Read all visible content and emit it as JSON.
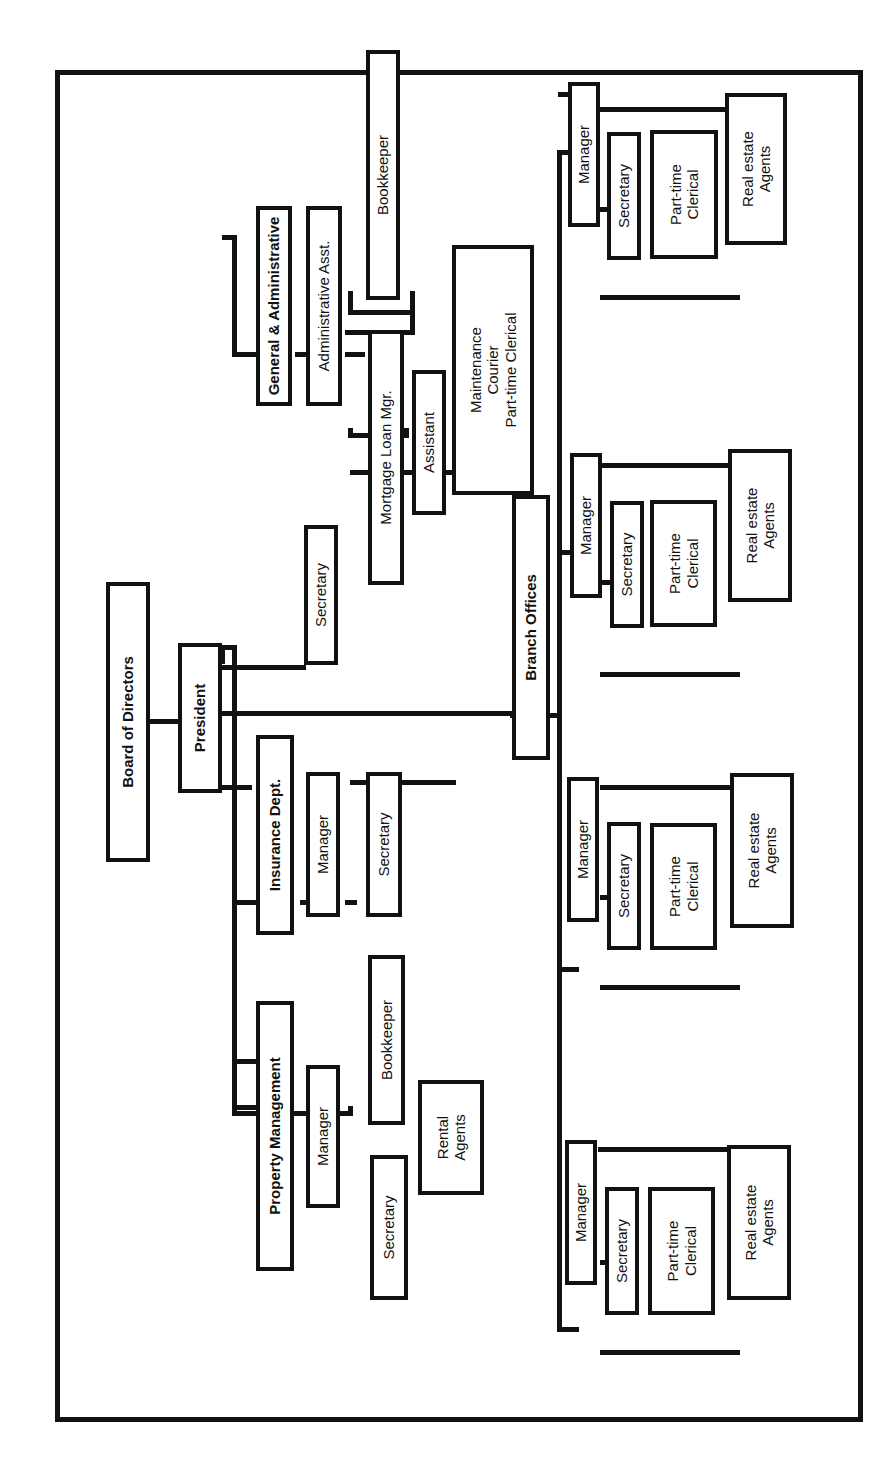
{
  "chart": {
    "root": "Board of Directors",
    "president": "President",
    "president_secretary": "Secretary",
    "general_admin": {
      "title": "General & Administrative",
      "admin_asst": "Administrative Asst.",
      "bookkeeper": "Bookkeeper",
      "mortgage_loan_mgr": "Mortgage Loan Mgr.",
      "assistant": "Assistant",
      "support": "Maintenance\nCourier\nPart-time Clerical"
    },
    "insurance": {
      "title": "Insurance Dept.",
      "manager": "Manager",
      "secretary": "Secretary"
    },
    "property": {
      "title": "Property Management",
      "manager": "Manager",
      "bookkeeper": "Bookkeeper",
      "secretary": "Secretary",
      "rental_agents": "Rental\nAgents"
    },
    "branch": {
      "title": "Branch Offices",
      "offices": [
        {
          "manager": "Manager",
          "secretary": "Secretary",
          "clerical": "Part-time\nClerical",
          "agents": "Real estate\nAgents"
        },
        {
          "manager": "Manager",
          "secretary": "Secretary",
          "clerical": "Part-time\nClerical",
          "agents": "Real estate\nAgents"
        },
        {
          "manager": "Manager",
          "secretary": "Secretary",
          "clerical": "Part-time\nClerical",
          "agents": "Real estate\nAgents"
        },
        {
          "manager": "Manager",
          "secretary": "Secretary",
          "clerical": "Part-time\nClerical",
          "agents": "Real estate\nAgents"
        }
      ]
    }
  }
}
